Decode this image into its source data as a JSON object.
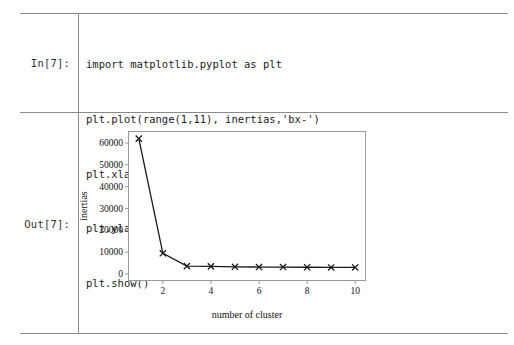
{
  "notebook": {
    "input_prompt": "In[7]:",
    "output_prompt": "Out[7]:",
    "code_lines": [
      "import matplotlib.pyplot as plt",
      "plt.plot(range(1,11), inertias,'bx-')",
      "plt.xlabel('number of cluster')",
      "plt.ylabel('inertias')",
      "plt.show()"
    ]
  },
  "chart_data": {
    "type": "line",
    "title": "",
    "xlabel": "number of cluster",
    "ylabel": "inertias",
    "x": [
      1,
      2,
      3,
      4,
      5,
      6,
      7,
      8,
      9,
      10
    ],
    "values": [
      62000,
      9500,
      3600,
      3500,
      3300,
      3200,
      3200,
      3100,
      3000,
      3000
    ],
    "series": [
      {
        "name": "inertias",
        "marker": "x",
        "linestyle": "-",
        "color": "#1a1a1a",
        "values": [
          62000,
          9500,
          3600,
          3500,
          3300,
          3200,
          3200,
          3100,
          3000,
          3000
        ]
      }
    ],
    "xlim": [
      0.55,
      10.45
    ],
    "ylim": [
      -3200,
      65500
    ],
    "xticks": [
      2,
      4,
      6,
      8,
      10
    ],
    "xtick_labels": [
      "2",
      "4",
      "6",
      "8",
      "10"
    ],
    "yticks": [
      0,
      10000,
      20000,
      30000,
      40000,
      50000,
      60000
    ],
    "ytick_labels": [
      "0",
      "10000",
      "20000",
      "30000",
      "40000",
      "50000",
      "60000"
    ],
    "grid": false,
    "legend": null,
    "frame_color": "#9a9a9a"
  },
  "colors": {
    "rule": "#8a8a8a",
    "text": "#1a1a1a",
    "line": "#1a1a1a",
    "background": "#ffffff"
  }
}
